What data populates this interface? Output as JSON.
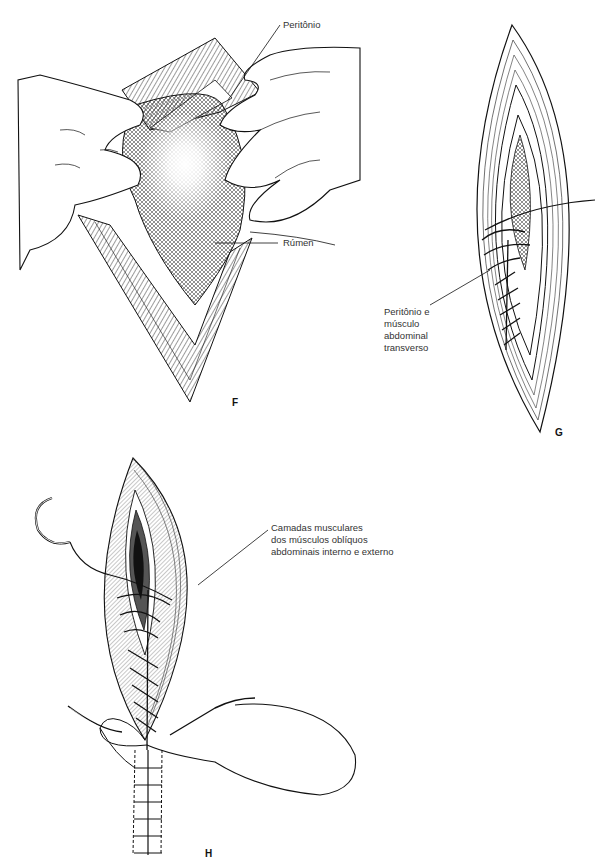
{
  "figure": {
    "panels": [
      {
        "id": "F",
        "letter": "F",
        "description": "Hands retracting incision edges exposing rumen through peritoneum",
        "labels": [
          {
            "text": "Peritônio"
          },
          {
            "text": "Rúmen"
          }
        ]
      },
      {
        "id": "G",
        "letter": "G",
        "description": "Continuous suture closing peritoneum and transverse abdominal muscle",
        "labels": [
          {
            "lines": [
              "Peritônio e",
              "músculo",
              "abdominal",
              "transverso"
            ]
          }
        ]
      },
      {
        "id": "H",
        "letter": "H",
        "description": "Continuous suture closing internal and external oblique muscle layers with needle",
        "labels": [
          {
            "lines": [
              "Camadas musculares",
              "dos músculos oblíquos",
              "abdominais interno e externo"
            ]
          }
        ]
      }
    ],
    "colors": {
      "ink": "#1a1a1a",
      "text": "#333333",
      "background": "#ffffff"
    }
  }
}
